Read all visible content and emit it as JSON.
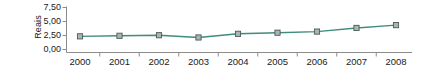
{
  "chart_data": {
    "type": "line",
    "title": "",
    "xlabel": "",
    "ylabel": "Reais",
    "categories": [
      "2000",
      "2001",
      "2002",
      "2003",
      "2004",
      "2005",
      "2006",
      "2007",
      "2008"
    ],
    "values": [
      2.35,
      2.45,
      2.55,
      2.15,
      2.8,
      3.0,
      3.2,
      3.85,
      4.35
    ],
    "series": [
      {
        "name": "Reais",
        "values": [
          2.35,
          2.45,
          2.55,
          2.15,
          2.8,
          3.0,
          3.2,
          3.85,
          4.35
        ]
      }
    ],
    "ylim": [
      0,
      7.5
    ],
    "yticks": [
      0,
      2.5,
      5.0,
      7.5
    ],
    "ytick_labels": [
      "0,00",
      "2,50",
      "5,00",
      "7,50"
    ],
    "xtick_labels": [
      "2000",
      "2001",
      "2002",
      "2003",
      "2004",
      "2005",
      "2006",
      "2007",
      "2008"
    ],
    "grid": false,
    "legend": false,
    "legend_position": "none",
    "decimal_separator": ",",
    "line_color": "#3f8c7c",
    "marker_face_color": "#a9b5b2",
    "marker_edge_color": "#4a5a57",
    "axis_color": "#8c8c8c",
    "text_color": "#1a1a1a",
    "background_color": "#ffffff"
  },
  "axes": {
    "y_title": "Reais",
    "y_tick_labels": [
      "7,50",
      "5,00",
      "2,50",
      "0,00"
    ],
    "x_tick_labels": [
      "2000",
      "2001",
      "2002",
      "2003",
      "2004",
      "2005",
      "2006",
      "2007",
      "2008"
    ]
  }
}
